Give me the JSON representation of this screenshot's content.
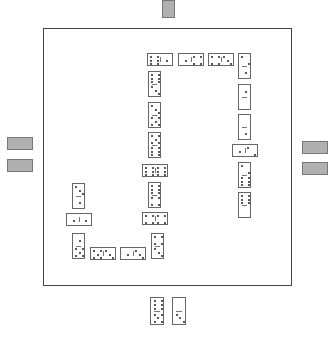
{
  "game": {
    "title": "Dominoes",
    "board": {
      "border_color": "#444444",
      "background": "#ffffff"
    },
    "opponents": {
      "top": {
        "hidden_tiles": 1
      },
      "left": {
        "hidden_tiles": 2
      },
      "right": {
        "hidden_tiles": 2
      }
    },
    "player_hand": [
      {
        "a": 6,
        "b": 5,
        "orientation": "vertical"
      },
      {
        "a": 0,
        "b": 3,
        "orientation": "vertical"
      }
    ],
    "chain": [
      {
        "x": 147,
        "y": 53,
        "w": 26,
        "h": 13,
        "o": "h",
        "a": 6,
        "b": 1
      },
      {
        "x": 178,
        "y": 53,
        "w": 26,
        "h": 13,
        "o": "h",
        "a": 1,
        "b": 4
      },
      {
        "x": 208,
        "y": 53,
        "w": 26,
        "h": 13,
        "o": "h",
        "a": 4,
        "b": 3
      },
      {
        "x": 238,
        "y": 53,
        "w": 13,
        "h": 26,
        "o": "v",
        "a": 2,
        "b": 1
      },
      {
        "x": 238,
        "y": 84,
        "w": 13,
        "h": 26,
        "o": "v",
        "a": 1,
        "b": 0
      },
      {
        "x": 238,
        "y": 114,
        "w": 13,
        "h": 26,
        "o": "v",
        "a": 0,
        "b": 1
      },
      {
        "x": 232,
        "y": 144,
        "w": 26,
        "h": 13,
        "o": "h",
        "a": 1,
        "b": 2
      },
      {
        "x": 238,
        "y": 162,
        "w": 13,
        "h": 26,
        "o": "v",
        "a": 2,
        "b": 6
      },
      {
        "x": 238,
        "y": 192,
        "w": 13,
        "h": 26,
        "o": "v",
        "a": 6,
        "b": 0
      },
      {
        "x": 148,
        "y": 71,
        "w": 13,
        "h": 26,
        "o": "v",
        "a": 6,
        "b": 3
      },
      {
        "x": 148,
        "y": 102,
        "w": 13,
        "h": 26,
        "o": "v",
        "a": 3,
        "b": 5
      },
      {
        "x": 148,
        "y": 132,
        "w": 13,
        "h": 26,
        "o": "v",
        "a": 5,
        "b": 6
      },
      {
        "x": 142,
        "y": 164,
        "w": 26,
        "h": 13,
        "o": "h",
        "a": 6,
        "b": 6
      },
      {
        "x": 148,
        "y": 182,
        "w": 13,
        "h": 26,
        "o": "v",
        "a": 6,
        "b": 4
      },
      {
        "x": 142,
        "y": 212,
        "w": 26,
        "h": 13,
        "o": "h",
        "a": 4,
        "b": 4
      },
      {
        "x": 151,
        "y": 233,
        "w": 13,
        "h": 26,
        "o": "v",
        "a": 4,
        "b": 3
      },
      {
        "x": 120,
        "y": 247,
        "w": 26,
        "h": 13,
        "o": "h",
        "a": 1,
        "b": 3
      },
      {
        "x": 90,
        "y": 247,
        "w": 26,
        "h": 13,
        "o": "h",
        "a": 5,
        "b": 3
      },
      {
        "x": 72,
        "y": 233,
        "w": 13,
        "h": 26,
        "o": "v",
        "a": 1,
        "b": 5
      },
      {
        "x": 66,
        "y": 213,
        "w": 26,
        "h": 13,
        "o": "h",
        "a": 1,
        "b": 1
      },
      {
        "x": 72,
        "y": 183,
        "w": 13,
        "h": 26,
        "o": "v",
        "a": 3,
        "b": 1
      }
    ]
  }
}
